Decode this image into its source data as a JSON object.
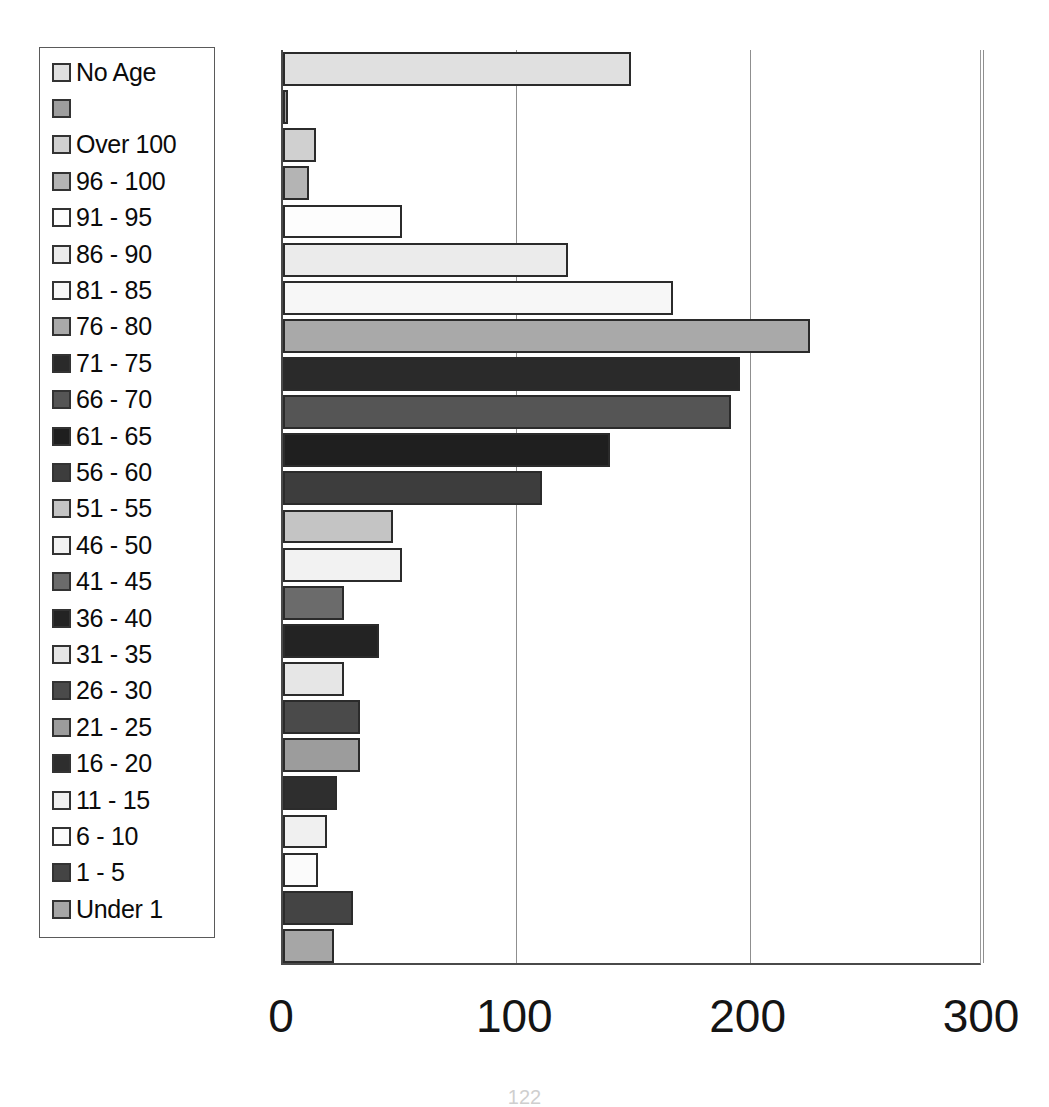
{
  "chart_data": {
    "type": "bar",
    "orientation": "horizontal",
    "title": "",
    "xlabel": "",
    "ylabel": "",
    "xlim": [
      0,
      300
    ],
    "xticks": [
      0,
      100,
      200,
      300
    ],
    "xtick_labels": [
      "0",
      "100",
      "200",
      "300"
    ],
    "grid": "vertical",
    "legend_position": "left-outside",
    "categories": [
      "No Age",
      "",
      "Over 100",
      "96 - 100",
      "91 - 95",
      "86 - 90",
      "81 - 85",
      "76 - 80",
      "71 - 75",
      "66 - 70",
      "61 - 65",
      "56 - 60",
      "51 - 55",
      "46 - 50",
      "41 - 45",
      "36 - 40",
      "31 - 35",
      "26 - 30",
      "21 - 25",
      "16 - 20",
      "11 - 15",
      "6 - 10",
      "1 - 5",
      "Under 1"
    ],
    "values": [
      149,
      2,
      14,
      11,
      51,
      122,
      167,
      226,
      196,
      192,
      140,
      111,
      47,
      51,
      26,
      41,
      26,
      33,
      33,
      23,
      19,
      15,
      30,
      22
    ],
    "series": [
      {
        "name": "Age groups",
        "values": [
          149,
          2,
          14,
          11,
          51,
          122,
          167,
          226,
          196,
          192,
          140,
          111,
          47,
          51,
          26,
          41,
          26,
          33,
          33,
          23,
          19,
          15,
          30,
          22
        ]
      }
    ],
    "fills": [
      "#e0e0e0",
      "#9e9e9e",
      "#d0d0d0",
      "#b4b4b4",
      "#fdfdfd",
      "#ebebeb",
      "#f7f7f7",
      "#a9a9a9",
      "#2a2a2a",
      "#555555",
      "#1f1f1f",
      "#3d3d3d",
      "#c4c4c4",
      "#f2f2f2",
      "#6b6b6b",
      "#232323",
      "#e6e6e6",
      "#4a4a4a",
      "#9c9c9c",
      "#2e2e2e",
      "#f0f0f0",
      "#fbfbfb",
      "#444444",
      "#a6a6a6"
    ]
  },
  "legend": {
    "items": [
      {
        "label": "No Age",
        "color": "#e0e0e0"
      },
      {
        "label": "",
        "color": "#9e9e9e"
      },
      {
        "label": "Over 100",
        "color": "#d0d0d0"
      },
      {
        "label": "96 - 100",
        "color": "#b4b4b4"
      },
      {
        "label": "91 - 95",
        "color": "#fdfdfd"
      },
      {
        "label": "86 - 90",
        "color": "#ebebeb"
      },
      {
        "label": "81 - 85",
        "color": "#f7f7f7"
      },
      {
        "label": "76 - 80",
        "color": "#a9a9a9"
      },
      {
        "label": "71 - 75",
        "color": "#2a2a2a"
      },
      {
        "label": "66 - 70",
        "color": "#555555"
      },
      {
        "label": "61 - 65",
        "color": "#1f1f1f"
      },
      {
        "label": "56 - 60",
        "color": "#3d3d3d"
      },
      {
        "label": "51 - 55",
        "color": "#c4c4c4"
      },
      {
        "label": "46 - 50",
        "color": "#f2f2f2"
      },
      {
        "label": "41 - 45",
        "color": "#6b6b6b"
      },
      {
        "label": "36 - 40",
        "color": "#232323"
      },
      {
        "label": "31 - 35",
        "color": "#e6e6e6"
      },
      {
        "label": "26 - 30",
        "color": "#4a4a4a"
      },
      {
        "label": "21 - 25",
        "color": "#9c9c9c"
      },
      {
        "label": "16 - 20",
        "color": "#2e2e2e"
      },
      {
        "label": "11 - 15",
        "color": "#f0f0f0"
      },
      {
        "label": "6 - 10",
        "color": "#fbfbfb"
      },
      {
        "label": "1 - 5",
        "color": "#444444"
      },
      {
        "label": "Under 1",
        "color": "#a6a6a6"
      }
    ]
  },
  "page": {
    "number": "122"
  }
}
